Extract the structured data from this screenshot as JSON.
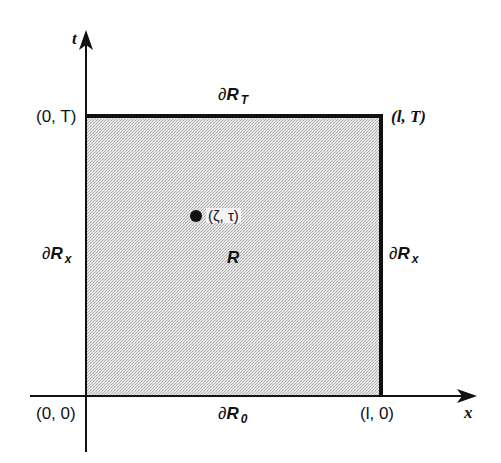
{
  "diagram": {
    "title": "",
    "colors": {
      "background": "#ffffff",
      "region_fill": "#d9d9d9",
      "line": "#111111",
      "text": "#111111"
    },
    "axes": {
      "x_label": "x",
      "t_label": "t"
    },
    "region": {
      "label": "R"
    },
    "boundaries": {
      "top": {
        "symbol": "∂",
        "base": "R",
        "sub": "T"
      },
      "bottom": {
        "symbol": "∂",
        "base": "R",
        "sub": "0"
      },
      "left": {
        "symbol": "∂",
        "base": "R",
        "sub": "x"
      },
      "right": {
        "symbol": "∂",
        "base": "R",
        "sub": "x"
      }
    },
    "corners": {
      "origin": "(0, 0)",
      "top_left": "(0, T)",
      "top_right": "(l, T)",
      "bottom_right": "(l, 0)"
    },
    "point": {
      "label": "(ζ, τ)"
    }
  }
}
